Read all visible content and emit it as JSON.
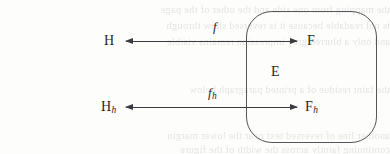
{
  "figure": {
    "kind": "commutative-diagram",
    "width": 390,
    "height": 154,
    "background_color": "#fdfdfb",
    "ink_color": "#26262b",
    "rule_color": "#3a3a40"
  },
  "nodes": {
    "top_left": {
      "base": "H",
      "sub": ""
    },
    "top_right": {
      "base": "F",
      "sub": ""
    },
    "bottom_left": {
      "base": "H",
      "sub": "h"
    },
    "bottom_right": {
      "base": "F",
      "sub": "h"
    },
    "region": {
      "base": "E",
      "sub": ""
    }
  },
  "arrows": [
    {
      "name": "f",
      "label_base": "f",
      "label_sub": "",
      "from": "H",
      "to": "F",
      "heads": "both",
      "row": "top"
    },
    {
      "name": "f_h",
      "label_base": "f",
      "label_sub": "h",
      "from": "H_h",
      "to": "F_h",
      "heads": "both",
      "row": "bottom"
    }
  ],
  "box": {
    "name": "E",
    "label": "E",
    "shape": "rounded-rectangle"
  },
  "bleed_through": {
    "note": "faint mirrored show-through text from the reverse page side",
    "lines": [
      "the mapping from one side and the other of the page",
      "is not readable because it is reversed show through",
      "and only a blurred grey impression remains visible",
      "",
      "",
      "the faint residue of a printed paragraph below",
      "",
      "",
      "another line of reversed text near the lower margin",
      "continuing faintly across the width of the figure"
    ]
  }
}
